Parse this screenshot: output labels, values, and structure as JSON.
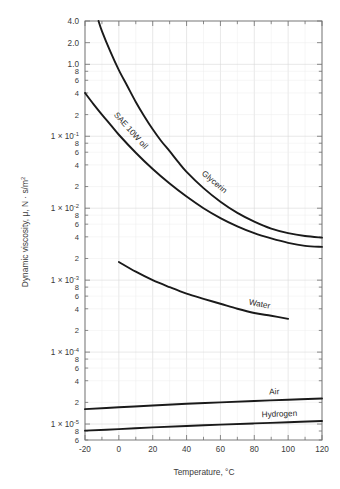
{
  "chart_data": {
    "type": "line",
    "title": "",
    "xlabel": "Temperature, °C",
    "ylabel": "Dynamic viscosity, μ, N · s/m²",
    "xscale": "linear",
    "yscale": "log",
    "xlim": [
      -20,
      120
    ],
    "ylim": [
      6e-06,
      4.0
    ],
    "grid": true,
    "legend_position": "inline-curve-labels",
    "xticks": [
      "-20",
      "0",
      "20",
      "40",
      "60",
      "80",
      "100",
      "120"
    ],
    "xtick_values": [
      -20,
      0,
      20,
      40,
      60,
      80,
      100,
      120
    ],
    "ytick_labels": [
      {
        "value": 4.0,
        "text": "4.0",
        "major": true
      },
      {
        "value": 2.0,
        "text": "2.0",
        "major": true
      },
      {
        "value": 1.0,
        "text": "1.0",
        "major": true
      },
      {
        "value": 0.8,
        "text": "8",
        "major": false
      },
      {
        "value": 0.6,
        "text": "6",
        "major": false
      },
      {
        "value": 0.4,
        "text": "4",
        "major": false
      },
      {
        "value": 0.2,
        "text": "2",
        "major": false
      },
      {
        "value": 0.1,
        "text": "1 × 10",
        "exp": "-1",
        "major": true
      },
      {
        "value": 0.08,
        "text": "8",
        "major": false
      },
      {
        "value": 0.06,
        "text": "6",
        "major": false
      },
      {
        "value": 0.04,
        "text": "4",
        "major": false
      },
      {
        "value": 0.02,
        "text": "2",
        "major": false
      },
      {
        "value": 0.01,
        "text": "1 × 10",
        "exp": "-2",
        "major": true
      },
      {
        "value": 0.008,
        "text": "8",
        "major": false
      },
      {
        "value": 0.006,
        "text": "6",
        "major": false
      },
      {
        "value": 0.004,
        "text": "4",
        "major": false
      },
      {
        "value": 0.002,
        "text": "2",
        "major": false
      },
      {
        "value": 0.001,
        "text": "1 × 10",
        "exp": "-3",
        "major": true
      },
      {
        "value": 0.0008,
        "text": "8",
        "major": false
      },
      {
        "value": 0.0006,
        "text": "6",
        "major": false
      },
      {
        "value": 0.0004,
        "text": "4",
        "major": false
      },
      {
        "value": 0.0002,
        "text": "2",
        "major": false
      },
      {
        "value": 0.0001,
        "text": "1 × 10",
        "exp": "-4",
        "major": true
      },
      {
        "value": 8e-05,
        "text": "8",
        "major": false
      },
      {
        "value": 6e-05,
        "text": "6",
        "major": false
      },
      {
        "value": 4e-05,
        "text": "4",
        "major": false
      },
      {
        "value": 2e-05,
        "text": "2",
        "major": false
      },
      {
        "value": 1e-05,
        "text": "1 × 10",
        "exp": "-5",
        "major": true
      },
      {
        "value": 8e-06,
        "text": "8",
        "major": false
      },
      {
        "value": 6e-06,
        "text": "6",
        "major": false
      }
    ],
    "series": [
      {
        "name": "Glycerin",
        "label": "Glycerin",
        "label_at_x": 52,
        "color": "#1a1a1a",
        "points": [
          [
            -12,
            4.0
          ],
          [
            -10,
            2.9
          ],
          [
            -5,
            1.5
          ],
          [
            0,
            0.83
          ],
          [
            5,
            0.5
          ],
          [
            10,
            0.3
          ],
          [
            15,
            0.19
          ],
          [
            20,
            0.125
          ],
          [
            25,
            0.086
          ],
          [
            30,
            0.062
          ],
          [
            35,
            0.044
          ],
          [
            40,
            0.032
          ],
          [
            50,
            0.019
          ],
          [
            60,
            0.0123
          ],
          [
            70,
            0.0086
          ],
          [
            80,
            0.0065
          ],
          [
            90,
            0.0052
          ],
          [
            100,
            0.0045
          ],
          [
            110,
            0.0041
          ],
          [
            120,
            0.0039
          ]
        ]
      },
      {
        "name": "SAE 10W oil",
        "label": "SAE 10W oil",
        "label_at_x": 2,
        "color": "#1a1a1a",
        "points": [
          [
            -20,
            0.4
          ],
          [
            -15,
            0.28
          ],
          [
            -10,
            0.2
          ],
          [
            -5,
            0.145
          ],
          [
            0,
            0.105
          ],
          [
            10,
            0.059
          ],
          [
            20,
            0.035
          ],
          [
            30,
            0.022
          ],
          [
            40,
            0.0145
          ],
          [
            50,
            0.01
          ],
          [
            60,
            0.0073
          ],
          [
            70,
            0.0056
          ],
          [
            80,
            0.0045
          ],
          [
            90,
            0.0038
          ],
          [
            100,
            0.0033
          ],
          [
            110,
            0.003
          ],
          [
            120,
            0.0029
          ]
        ]
      },
      {
        "name": "Water",
        "label": "Water",
        "label_at_x": 82,
        "color": "#1a1a1a",
        "points": [
          [
            0,
            0.00179
          ],
          [
            10,
            0.00131
          ],
          [
            20,
            0.001
          ],
          [
            30,
            0.0008
          ],
          [
            40,
            0.00065
          ],
          [
            50,
            0.00055
          ],
          [
            60,
            0.00047
          ],
          [
            70,
            0.0004
          ],
          [
            80,
            0.00035
          ],
          [
            90,
            0.00032
          ],
          [
            100,
            0.00029
          ]
        ]
      },
      {
        "name": "Air",
        "label": "Air",
        "label_at_x": 92,
        "color": "#1a1a1a",
        "points": [
          [
            -20,
            1.61e-05
          ],
          [
            0,
            1.71e-05
          ],
          [
            20,
            1.81e-05
          ],
          [
            40,
            1.91e-05
          ],
          [
            60,
            2e-05
          ],
          [
            80,
            2.09e-05
          ],
          [
            100,
            2.18e-05
          ],
          [
            120,
            2.26e-05
          ]
        ]
      },
      {
        "name": "Hydrogen",
        "label": "Hydrogen",
        "label_at_x": 95,
        "color": "#1a1a1a",
        "points": [
          [
            -20,
            8.1e-06
          ],
          [
            0,
            8.5e-06
          ],
          [
            20,
            9e-06
          ],
          [
            40,
            9.4e-06
          ],
          [
            60,
            9.8e-06
          ],
          [
            80,
            1.02e-05
          ],
          [
            100,
            1.06e-05
          ],
          [
            120,
            1.1e-05
          ]
        ]
      }
    ]
  },
  "figure": {
    "background": "#ffffff",
    "frame_color": "#7a7a7a",
    "grid_color": "#d8d8d8",
    "curve_color": "#1a1a1a"
  }
}
